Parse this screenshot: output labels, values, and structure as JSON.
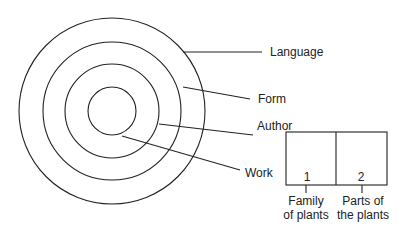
{
  "diagram": {
    "rings": [
      {
        "name": "Language",
        "label": "Language"
      },
      {
        "name": "Form",
        "label": "Form"
      },
      {
        "name": "Author",
        "label": "Author"
      },
      {
        "name": "Work",
        "label": "Work"
      }
    ],
    "box": {
      "cells": [
        {
          "number": "1",
          "caption_line1": "Family",
          "caption_line2": "of plants"
        },
        {
          "number": "2",
          "caption_line1": "Parts of",
          "caption_line2": "the plants"
        }
      ]
    }
  }
}
